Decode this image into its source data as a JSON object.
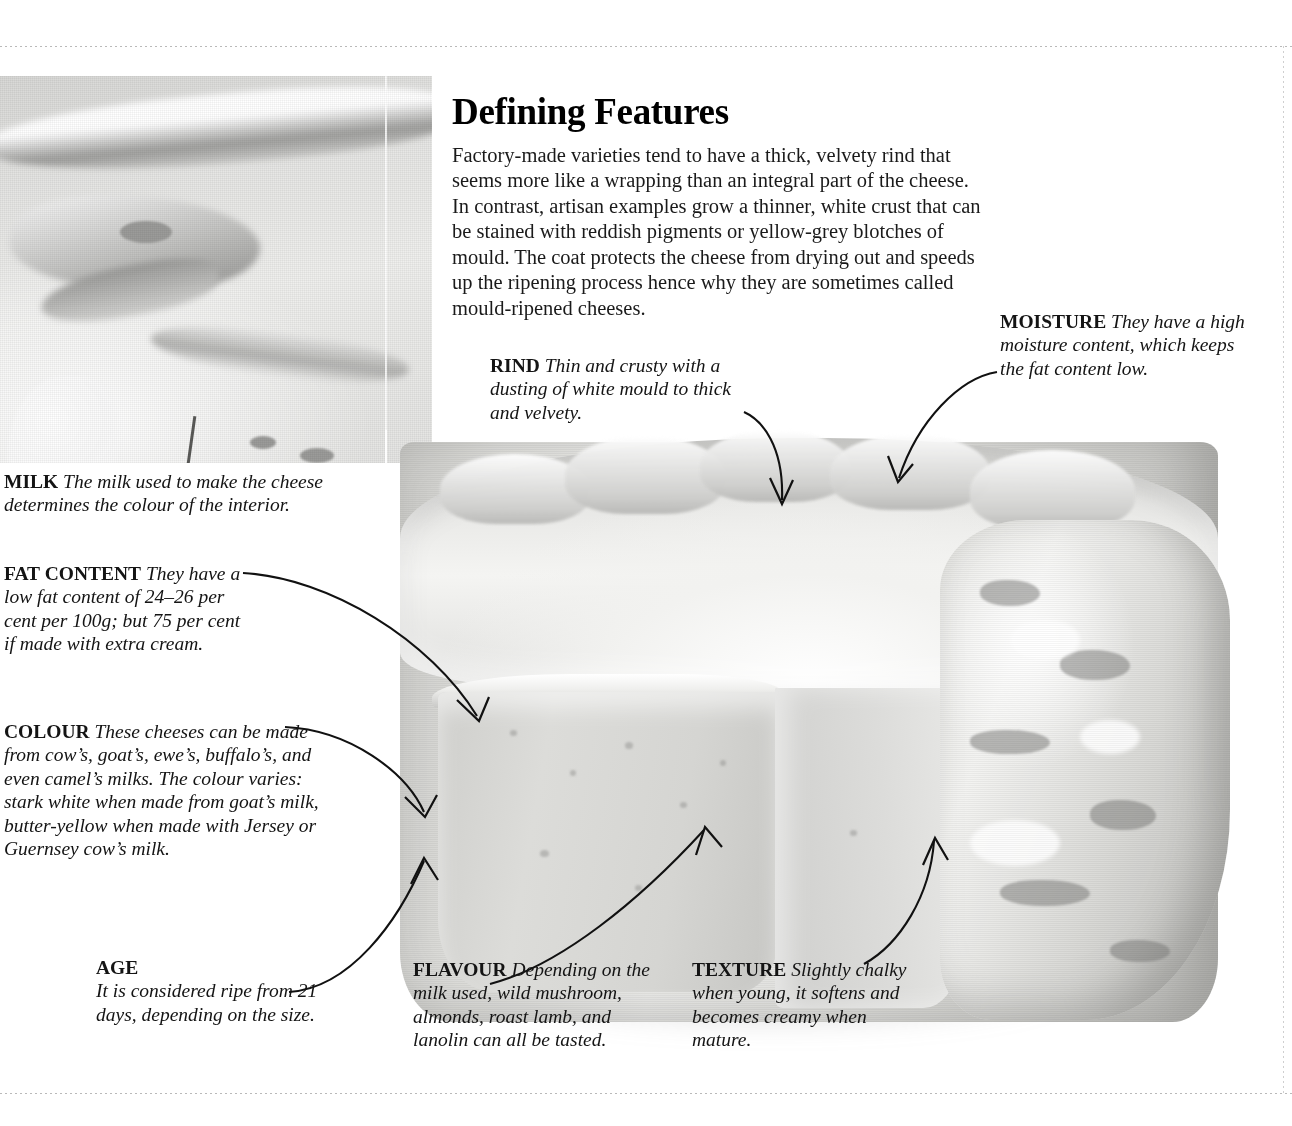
{
  "page": {
    "headline": "Defining Features",
    "intro": "Factory-made varieties tend to have a thick, velvety rind that seems more like a wrapping than an integral part of the cheese. In contrast, artisan examples grow a thinner, white crust that can be stained with reddish pigments or yellow-grey blotches of mould. The coat protects the cheese from drying out and speeds up the ripening process hence why they are sometimes called mould-ripened cheeses."
  },
  "callouts": {
    "rind": {
      "term": "RIND",
      "text": " Thin and crusty with a dusting of white mould to thick and velvety."
    },
    "moisture": {
      "term": "MOISTURE",
      "text": " They have a high moisture content, which keeps the fat content low."
    },
    "milk": {
      "term": "MILK",
      "text": " The milk used to make the cheese determines the colour of the interior."
    },
    "fat_content": {
      "term": "FAT CONTENT",
      "text": " They have a low fat content of 24–26 per cent per 100g; but 75 per cent if made with extra cream."
    },
    "colour": {
      "term": "COLOUR",
      "text": " These cheeses can be made from cow’s, goat’s, ewe’s, buffalo’s, and even camel’s milks. The colour varies: stark white when made from goat’s milk, butter-yellow when made with Jersey or Guernsey cow’s milk."
    },
    "age": {
      "term": "AGE",
      "text": "It is considered ripe from 21 days, depending on the size."
    },
    "flavour": {
      "term": "FLAVOUR",
      "text": " Depending on the milk used, wild mushroom, almonds, roast lamb, and lanolin can all be tasted."
    },
    "texture": {
      "term": "TEXTURE",
      "text": " Slightly chalky when young, it softens and becomes creamy when mature."
    }
  },
  "figures": {
    "inset_photo_alt": "close-up macro photograph of white mould-ripened cheese rind texture",
    "main_photo_alt": "grayscale photograph of a round soft-rind cheese with a wedge cut out revealing the pale interior paste"
  },
  "colors": {
    "text": "#141414",
    "rule": "#b9b9b9",
    "arrow": "#111111",
    "page_background": "#ffffff"
  }
}
